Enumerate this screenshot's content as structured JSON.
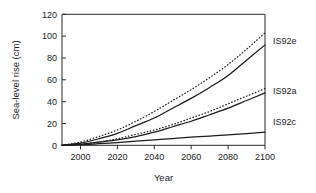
{
  "chart_data": {
    "type": "line",
    "title": "",
    "xlabel": "Year",
    "ylabel": "Sea-level rise (cm)",
    "xlim": [
      1990,
      2100
    ],
    "ylim": [
      0,
      120
    ],
    "xticks": [
      2000,
      2020,
      2040,
      2060,
      2080,
      2100
    ],
    "yticks": [
      0,
      20,
      40,
      60,
      80,
      100,
      120
    ],
    "grid": false,
    "legend_position": "right-inline",
    "x": [
      1990,
      2000,
      2010,
      2020,
      2030,
      2040,
      2050,
      2060,
      2070,
      2080,
      2090,
      2100
    ],
    "series": [
      {
        "name": "IS92e high",
        "label": "IS92e",
        "style": "dotted",
        "values": [
          0,
          3,
          8,
          14,
          22,
          31,
          41,
          51,
          62,
          74,
          88,
          103
        ]
      },
      {
        "name": "IS92e mid",
        "label": "IS92e",
        "style": "solid",
        "values": [
          0,
          2,
          6,
          11,
          18,
          25,
          34,
          43,
          53,
          64,
          78,
          92
        ]
      },
      {
        "name": "IS92a high",
        "label": "IS92a",
        "style": "dotted",
        "values": [
          0,
          1,
          3,
          6,
          10,
          14,
          19,
          25,
          31,
          38,
          45,
          52
        ]
      },
      {
        "name": "IS92a mid",
        "label": "IS92a",
        "style": "solid",
        "values": [
          0,
          1,
          3,
          5,
          8,
          12,
          17,
          22,
          28,
          34,
          41,
          48
        ]
      },
      {
        "name": "IS92c low",
        "label": "IS92c",
        "style": "solid",
        "values": [
          0,
          0.5,
          1.5,
          2.5,
          3.8,
          5.0,
          6.2,
          7.4,
          8.5,
          9.6,
          10.8,
          12
        ]
      }
    ],
    "series_labels": [
      {
        "text": "IS92e",
        "at_value": 103
      },
      {
        "text": "IS92a",
        "at_value": 52
      },
      {
        "text": "IS92c",
        "at_value": 22
      }
    ]
  },
  "axis": {
    "y_title": "Sea-level rise (cm)",
    "x_title": "Year",
    "y_tick_labels": [
      "0",
      "20",
      "40",
      "60",
      "80",
      "100",
      "120"
    ],
    "x_tick_labels": [
      "2000",
      "2020",
      "2040",
      "2060",
      "2080",
      "2100"
    ]
  },
  "labels": {
    "is92e": "IS92e",
    "is92a": "IS92a",
    "is92c": "IS92c"
  },
  "colors": {
    "line": "#1b1b1b",
    "axis": "#2a2a2a",
    "text": "#1a1a1a",
    "background": "#ffffff"
  }
}
